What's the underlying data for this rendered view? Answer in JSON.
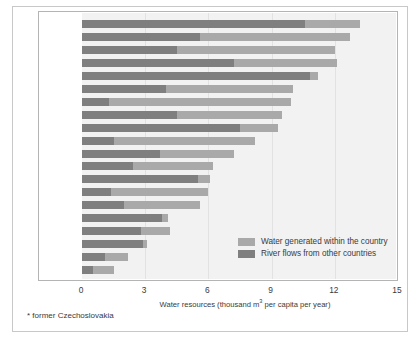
{
  "chart_data": {
    "type": "bar",
    "orientation": "horizontal",
    "stacked": true,
    "title": "",
    "xlabel": "Water resources (thousand m3 per capita per year)",
    "xlabel_parts": {
      "pre": "Water resources (thousand m",
      "sup": "3",
      "post": " per capita per year)"
    },
    "ylabel": "",
    "xlim": [
      0,
      15
    ],
    "xticks": [
      0,
      3,
      6,
      9,
      12,
      15
    ],
    "xtick_labels": [
      "0",
      "3",
      "6",
      "9",
      "12",
      "15"
    ],
    "grid": true,
    "legend_position": "inside-bottom-right",
    "categories": [
      "Luxembourg",
      "Albania",
      "Austria",
      "Latvia",
      "Hungary",
      "Croatia",
      "Slovenia",
      "Estonia",
      "Romania",
      "Switzerland",
      "Portugal",
      "Lithuania",
      "former CSFR*",
      "The Netherlands",
      "Greece",
      "Belarus",
      "Ukraine",
      "Moldova",
      "Germany",
      "Belgium"
    ],
    "series": [
      {
        "name": "River flows from other countries",
        "color": "#7f7f7f",
        "values": [
          10.6,
          5.6,
          4.5,
          7.2,
          10.8,
          4.0,
          1.3,
          4.5,
          7.5,
          1.5,
          3.7,
          2.4,
          5.5,
          1.4,
          2.0,
          3.8,
          2.8,
          2.9,
          1.1,
          0.5
        ]
      },
      {
        "name": "Water generated within the country",
        "color": "#a9a9a9",
        "values": [
          2.6,
          7.1,
          7.5,
          4.9,
          0.4,
          6.0,
          8.6,
          5.0,
          1.8,
          6.7,
          3.5,
          3.8,
          0.6,
          4.6,
          3.6,
          0.3,
          1.4,
          0.2,
          1.1,
          1.0
        ]
      }
    ],
    "totals": [
      13.2,
      12.7,
      12.0,
      12.1,
      11.2,
      10.0,
      9.9,
      9.5,
      9.3,
      8.2,
      7.2,
      6.2,
      6.1,
      6.0,
      5.6,
      4.1,
      4.2,
      3.1,
      2.2,
      1.5
    ],
    "annotations": [
      "* former Czechoslovakia"
    ]
  },
  "legend": {
    "items": [
      {
        "label": "Water generated within the country",
        "color": "#a9a9a9"
      },
      {
        "label": "River flows from other countries",
        "color": "#7f7f7f"
      }
    ]
  },
  "footnote": "* former Czechoslovakia"
}
